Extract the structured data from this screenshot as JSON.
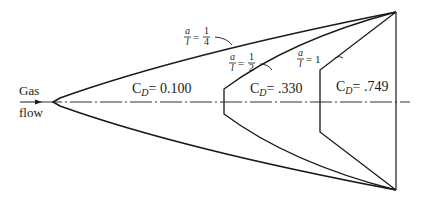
{
  "diagram": {
    "flow_label_line1": "Gas",
    "flow_label_line2": "flow",
    "bodies": [
      {
        "ratio_num": "a",
        "ratio_den": "l",
        "eq": "=",
        "value_num": "1",
        "value_den": "4",
        "cd_label": "C",
        "cd_sub": "D",
        "cd_value": "= 0.100"
      },
      {
        "ratio_num": "a",
        "ratio_den": "l",
        "eq": "=",
        "value_num": "1",
        "value_den": "2",
        "cd_label": "C",
        "cd_sub": "D",
        "cd_value": "= .330"
      },
      {
        "ratio_num": "a",
        "ratio_den": "l",
        "eq": "= 1",
        "cd_label": "C",
        "cd_sub": "D",
        "cd_value": "= .749"
      }
    ],
    "colors": {
      "line": "#1a1a1a",
      "background": "#ffffff"
    }
  }
}
